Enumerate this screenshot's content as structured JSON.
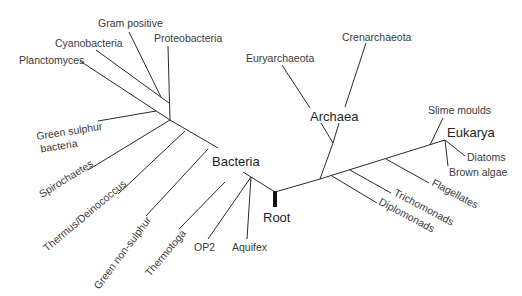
{
  "diagram": {
    "type": "phylogenetic-tree",
    "root": {
      "label": "Root"
    },
    "domains": [
      {
        "name": "Bacteria",
        "label": "Bacteria"
      },
      {
        "name": "Archaea",
        "label": "Archaea"
      },
      {
        "name": "Eukarya",
        "label": "Eukarya"
      }
    ],
    "bacteria": [
      {
        "label": "Gram positive"
      },
      {
        "label": "Proteobacteria"
      },
      {
        "label": "Cyanobacteria"
      },
      {
        "label": "Planctomyces"
      },
      {
        "label": "Green sulphur",
        "label2": "bacteria"
      },
      {
        "label": "Spirochaetes"
      },
      {
        "label": "Thermus/Deinococcus"
      },
      {
        "label": "Green non-sulphur"
      },
      {
        "label": "Thermotoga"
      },
      {
        "label": "OP2"
      },
      {
        "label": "Aquifex"
      }
    ],
    "archaea": [
      {
        "label": "Euryarchaeota"
      },
      {
        "label": "Crenarchaeota"
      }
    ],
    "eukarya": [
      {
        "label": "Slime moulds"
      },
      {
        "label": "Diatoms"
      },
      {
        "label": "Brown algae"
      },
      {
        "label": "Flagellates"
      },
      {
        "label": "Trichomonads"
      },
      {
        "label": "Diplomonads"
      }
    ],
    "colors": {
      "line": "#2a2a2a",
      "text": "#3a3a3a",
      "root_bar": "#111111",
      "background": "#ffffff"
    }
  }
}
